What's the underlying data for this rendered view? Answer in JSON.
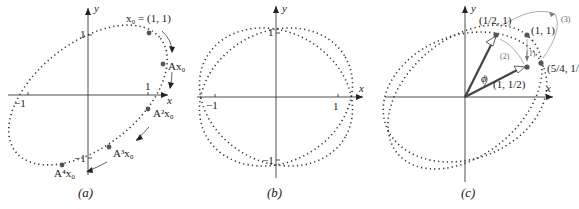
{
  "figure": {
    "panels": [
      {
        "id": "a",
        "caption": "(a)",
        "axis_labels": {
          "x": "x",
          "y": "y"
        },
        "ticks": {
          "x_pos": "1",
          "x_neg": "−1",
          "y_pos": "1",
          "y_neg": "−1"
        },
        "points": [
          {
            "label": "x₀ = (1, 1)",
            "name": "x0"
          },
          {
            "label": "Ax₀",
            "name": "Ax0"
          },
          {
            "label": "A²x₀",
            "name": "A2x0"
          },
          {
            "label": "A³x₀",
            "name": "A3x0"
          },
          {
            "label": "A⁴x₀",
            "name": "A4x0"
          }
        ]
      },
      {
        "id": "b",
        "caption": "(b)",
        "axis_labels": {
          "x": "x",
          "y": "y"
        },
        "ticks": {
          "x_pos": "1",
          "x_neg": "−1",
          "y_pos": "1",
          "y_neg": "−1"
        }
      },
      {
        "id": "c",
        "caption": "(c)",
        "axis_labels": {
          "x": "x",
          "y": "y"
        },
        "angle_label": "ϕ",
        "points": [
          {
            "label": "(1/2, 1)",
            "name": "half-one"
          },
          {
            "label": "(1, 1)",
            "name": "one-one"
          },
          {
            "label": "(1, 1/2)",
            "name": "one-half"
          },
          {
            "label": "(5/4, 1/2)",
            "name": "five-quarters-half"
          }
        ],
        "step_labels": [
          "(1)",
          "(2)",
          "(3)"
        ]
      }
    ]
  }
}
